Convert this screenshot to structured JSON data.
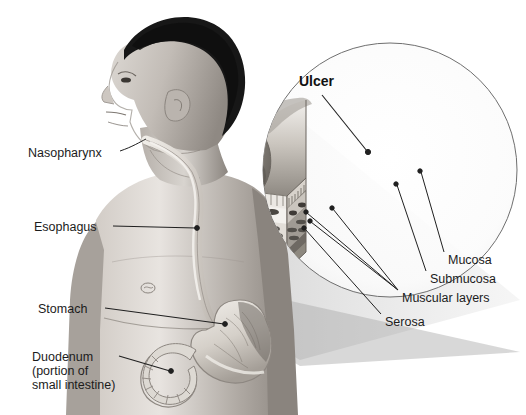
{
  "figure": {
    "title_visible": false,
    "type": "medical-anatomical-illustration",
    "background_color": "#ffffff",
    "label_text_color": "#1c1c1c",
    "leader_line_color": "#202020"
  },
  "body_labels": [
    {
      "id": "nasopharynx",
      "text": "Nasopharynx",
      "x": 28,
      "y": 148,
      "leader": {
        "from_x": 120,
        "from_y": 154,
        "to_x": 146,
        "to_y": 141
      }
    },
    {
      "id": "esophagus",
      "text": "Esophagus",
      "x": 34,
      "y": 222,
      "leader": {
        "from_x": 113,
        "from_y": 228,
        "to_x": 196,
        "to_y": 229
      }
    },
    {
      "id": "stomach",
      "text": "Stomach",
      "x": 38,
      "y": 304,
      "leader": {
        "from_x": 105,
        "from_y": 310,
        "to_x": 224,
        "to_y": 324
      }
    },
    {
      "id": "duodenum",
      "text": "Duodenum",
      "sub_lines": [
        "(portion of",
        "small intestine)"
      ],
      "x": 32,
      "y": 352,
      "leader": {
        "from_x": 117,
        "from_y": 358,
        "to_x": 170,
        "to_y": 372
      }
    }
  ],
  "inset_labels": [
    {
      "id": "ulcer",
      "text": "Ulcer",
      "bold": true,
      "x": 299,
      "y": 77,
      "leader": {
        "from_x": 323,
        "from_y": 96,
        "to_x": 366,
        "to_y": 152
      }
    },
    {
      "id": "mucosa",
      "text": "Mucosa",
      "x": 448,
      "y": 255,
      "leader": {
        "from_x": 444,
        "from_y": 258,
        "to_x": 420,
        "to_y": 171
      }
    },
    {
      "id": "submucosa",
      "text": "Submucosa",
      "x": 430,
      "y": 274,
      "leader": {
        "from_x": 426,
        "from_y": 276,
        "to_x": 396,
        "to_y": 184
      }
    },
    {
      "id": "muscular-layers",
      "text": "Muscular layers",
      "x": 402,
      "y": 293,
      "leader": {
        "from_x": 398,
        "from_y": 294,
        "to_x": 332,
        "to_y": 208
      }
    },
    {
      "id": "serosa",
      "text": "Serosa",
      "x": 385,
      "y": 317,
      "leader": {
        "from_x": 381,
        "from_y": 317,
        "to_x": 310,
        "to_y": 224
      }
    }
  ],
  "tissue_layers": [
    {
      "name": "Mucosa",
      "order": 1,
      "描述": "villous vertical striations at the luminal surface"
    },
    {
      "name": "Submucosa",
      "order": 2,
      "描述": "pale band containing dark oval glands"
    },
    {
      "name": "Muscular layers",
      "order": 3,
      "描述": "dense dark elliptical muscle bundles in bands"
    },
    {
      "name": "Serosa",
      "order": 4,
      "描述": "thin outermost layer at the block base"
    }
  ],
  "inset_circle": {
    "center_x": 390,
    "center_y": 170,
    "radius": 127
  },
  "magnifier_cone": {
    "apex_x": 232,
    "apex_y": 325,
    "spread": "fan to inset circle"
  },
  "palette": {
    "ink": "#1c1c1c",
    "skin_light": "#e6e2de",
    "skin_mid": "#b9b3ad",
    "skin_dark": "#7d7771",
    "hair": "#171717",
    "tissue_pale": "#efece7",
    "tissue_mid": "#b5b0a9",
    "tissue_dark": "#5d5a56",
    "cone": "#bdbdbd"
  }
}
